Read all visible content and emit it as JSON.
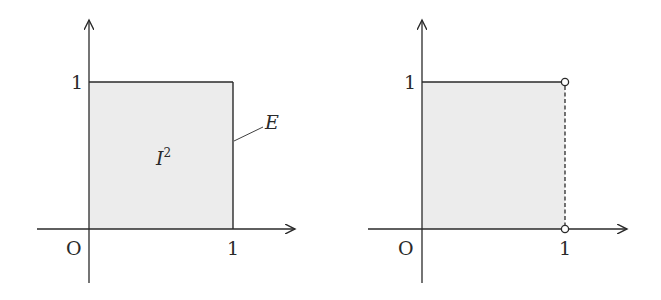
{
  "colors": {
    "stroke": "#2a2a2a",
    "fill": "#ececec",
    "background": "#ffffff"
  },
  "left_diagram": {
    "origin_label": "O",
    "x_tick_label": "1",
    "y_tick_label": "1",
    "region_label": "I",
    "region_superscript": "2",
    "edge_label": "E"
  },
  "right_diagram": {
    "origin_label": "O",
    "x_tick_label": "1",
    "y_tick_label": "1",
    "right_edge_style": "dashed",
    "open_points": [
      "(1,1)",
      "(1,0)"
    ]
  }
}
